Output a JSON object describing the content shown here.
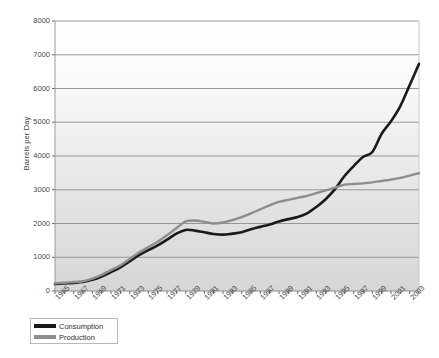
{
  "chart_data": {
    "type": "line",
    "title": "",
    "xlabel": "",
    "ylabel": "Barrels per Day",
    "ylim": [
      0,
      8000
    ],
    "ytick_values": [
      0,
      1000,
      2000,
      3000,
      4000,
      5000,
      6000,
      7000,
      8000
    ],
    "ytick_labels": [
      "0",
      "1000",
      "2000",
      "3000",
      "4000",
      "5000",
      "6000",
      "7000",
      "8000"
    ],
    "grid": "horizontal",
    "legend_position": "bottom-left",
    "x": [
      1965,
      1966,
      1967,
      1968,
      1969,
      1970,
      1971,
      1972,
      1973,
      1974,
      1975,
      1976,
      1977,
      1978,
      1979,
      1980,
      1981,
      1982,
      1983,
      1984,
      1985,
      1986,
      1987,
      1988,
      1989,
      1990,
      1991,
      1992,
      1993,
      1994,
      1995,
      1996,
      1997,
      1998,
      1999,
      2000,
      2001,
      2002,
      2003,
      2004
    ],
    "xtick_labels": [
      "1965",
      "1967",
      "1969",
      "1971",
      "1973",
      "1975",
      "1977",
      "1979",
      "1981",
      "1983",
      "1985",
      "1987",
      "1989",
      "1991",
      "1993",
      "1995",
      "1997",
      "1999",
      "2001",
      "2003"
    ],
    "series": [
      {
        "name": "Consumption",
        "color": "#1a1a1a",
        "values": [
          210,
          225,
          240,
          265,
          330,
          430,
          560,
          700,
          880,
          1060,
          1210,
          1350,
          1520,
          1700,
          1810,
          1790,
          1740,
          1690,
          1670,
          1700,
          1740,
          1830,
          1900,
          1970,
          2060,
          2130,
          2190,
          2300,
          2490,
          2720,
          3020,
          3400,
          3700,
          3970,
          4120,
          4660,
          5030,
          5480,
          6100,
          6730
        ]
      },
      {
        "name": "Production",
        "color": "#8d8d8d",
        "values": [
          230,
          245,
          265,
          290,
          370,
          480,
          620,
          760,
          950,
          1140,
          1300,
          1460,
          1650,
          1860,
          2060,
          2090,
          2050,
          2000,
          2030,
          2100,
          2190,
          2300,
          2420,
          2540,
          2640,
          2700,
          2760,
          2820,
          2900,
          2980,
          3060,
          3150,
          3170,
          3190,
          3220,
          3260,
          3300,
          3350,
          3420,
          3490
        ]
      }
    ]
  },
  "legend": {
    "items": [
      {
        "label": "Consumption",
        "color": "#1a1a1a"
      },
      {
        "label": "Production",
        "color": "#8d8d8d"
      }
    ]
  }
}
